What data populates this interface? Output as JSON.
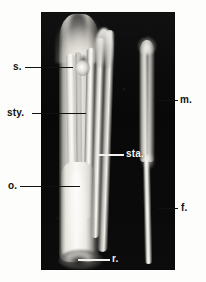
{
  "figure": {
    "type": "botanical-photomicrograph",
    "background_color": "#ffffff",
    "plate_color": "#0a0a0a",
    "label_dark_color": "#111111",
    "label_light_color": "#f4f4f0"
  },
  "labels": [
    {
      "key": "p",
      "text": "p.",
      "name": "label-perianth",
      "tone": "dark",
      "meaning": "perianth"
    },
    {
      "key": "s",
      "text": "s.",
      "name": "label-stigma",
      "tone": "dark",
      "meaning": "stigma"
    },
    {
      "key": "sty",
      "text": "sty.",
      "name": "label-style",
      "tone": "dark",
      "meaning": "style"
    },
    {
      "key": "sta",
      "text": "sta.",
      "name": "label-stamen",
      "tone": "light",
      "meaning": "stamen"
    },
    {
      "key": "m",
      "text": "m.",
      "name": "label-anther",
      "tone": "dark",
      "meaning": "anther"
    },
    {
      "key": "o",
      "text": "o.",
      "name": "label-ovary",
      "tone": "dark",
      "meaning": "ovary"
    },
    {
      "key": "f",
      "text": "f.",
      "name": "label-filament",
      "tone": "dark",
      "meaning": "filament"
    },
    {
      "key": "r",
      "text": "r.",
      "name": "label-receptacle",
      "tone": "light",
      "meaning": "receptacle"
    }
  ]
}
